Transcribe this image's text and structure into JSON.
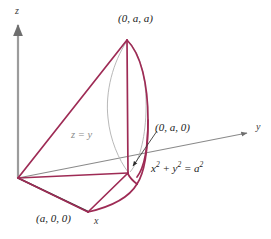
{
  "figure": {
    "background_color": "#ffffff",
    "curve_color": "#9e2b55",
    "axis_color": "#7a7a7a",
    "hidden_edge_color": "#a9a9a9",
    "text_color": "#1a1a1a",
    "plane_label_color": "#8a8a8a",
    "axes": [
      {
        "name": "z",
        "label": "z",
        "label_x": 15,
        "label_y": 5
      },
      {
        "name": "y",
        "label": "y",
        "label_x": 256,
        "label_y": 122
      },
      {
        "name": "x",
        "label": "x",
        "label_x": 94,
        "label_y": 216
      }
    ],
    "points": [
      {
        "name": "apex",
        "label": "(0, a, a)",
        "label_x": 120,
        "label_y": 14,
        "px": 127,
        "py": 40
      },
      {
        "name": "y-axis-point",
        "label": "(0, a, 0)",
        "label_x": 156,
        "label_y": 122,
        "px": 128,
        "py": 172
      },
      {
        "name": "x-axis-point",
        "label": "(a, 0, 0)",
        "label_x": 37,
        "label_y": 214,
        "px": 88,
        "py": 212
      },
      {
        "name": "origin",
        "label": "",
        "px": 18,
        "py": 178
      }
    ],
    "annotations": [
      {
        "name": "plane-equation",
        "text_html": "z = y",
        "x": 72,
        "y": 131,
        "style": "plane"
      },
      {
        "name": "cylinder-equation",
        "text_html": "x<sup>2</sup> + y<sup>2</sup> = a<sup>2</sup>",
        "x": 152,
        "y": 165,
        "style": "equation"
      }
    ]
  },
  "chart_data": {
    "type": "line",
    "xlabel": "x",
    "ylabel": "y",
    "zlabel": "z",
    "grid": false,
    "legend": "none",
    "surfaces": [
      {
        "name": "cylinder",
        "equation": "x^2 + y^2 = a^2"
      },
      {
        "name": "plane",
        "equation": "z = y"
      }
    ],
    "vertices": [
      {
        "label": "(0, a, a)",
        "x": 0,
        "y": "a",
        "z": "a"
      },
      {
        "label": "(0, a, 0)",
        "x": 0,
        "y": "a",
        "z": 0
      },
      {
        "label": "(a, 0, 0)",
        "x": "a",
        "y": 0,
        "z": 0
      },
      {
        "label": "origin",
        "x": 0,
        "y": 0,
        "z": 0
      }
    ]
  }
}
